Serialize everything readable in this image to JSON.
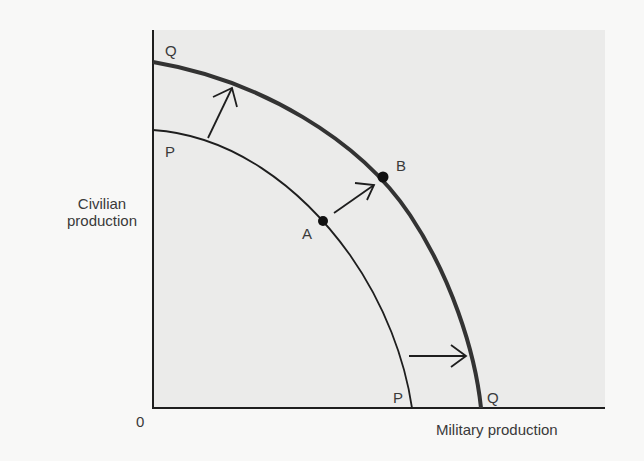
{
  "diagram": {
    "type": "production-possibilities-frontier",
    "y_axis_label_line1": "Civilian",
    "y_axis_label_line2": "production",
    "x_axis_label": "Military production",
    "origin_label": "0",
    "curves": [
      {
        "name": "P",
        "label_top": "P",
        "label_bottom": "P",
        "style": "thin",
        "description": "original frontier"
      },
      {
        "name": "Q",
        "label_top": "Q",
        "label_bottom": "Q",
        "style": "thick",
        "description": "expanded frontier"
      }
    ],
    "points": [
      {
        "label": "A",
        "on_curve": "P"
      },
      {
        "label": "B",
        "on_curve": "Q"
      }
    ],
    "arrows": [
      {
        "from": "P",
        "to": "Q",
        "position": "upper-left"
      },
      {
        "from": "A",
        "to": "B",
        "position": "middle"
      },
      {
        "from": "P",
        "to": "Q",
        "position": "lower-right"
      }
    ],
    "colors": {
      "background": "#f8f8f7",
      "panel": "#ebebea",
      "line": "#1e1e1e",
      "curve_q": "#3a3a3a"
    }
  }
}
